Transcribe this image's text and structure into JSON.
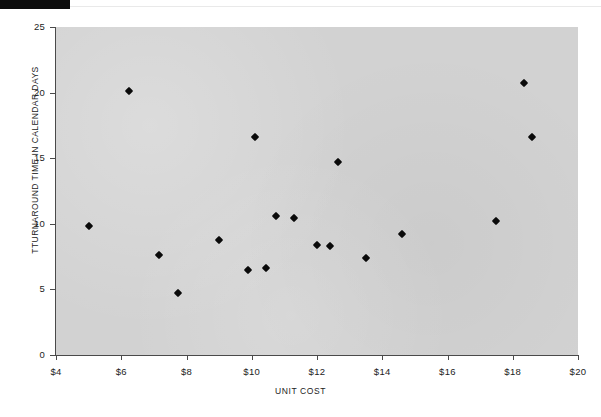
{
  "figure": {
    "top_bar_present": true
  },
  "chart_data": {
    "type": "scatter",
    "title": "",
    "xlabel": "UNIT COST",
    "ylabel": "TTURNAROUND TIME IN CALENDAR DAYS",
    "xlim": [
      4,
      20
    ],
    "ylim": [
      0,
      25
    ],
    "xticks": [
      4,
      6,
      8,
      10,
      12,
      14,
      16,
      18,
      20
    ],
    "xtick_labels": [
      "$4",
      "$6",
      "$8",
      "$10",
      "$12",
      "$14",
      "$16",
      "$18",
      "$20"
    ],
    "yticks": [
      0,
      5,
      10,
      15,
      20,
      25
    ],
    "ytick_labels": [
      "0",
      "5",
      "10",
      "15",
      "20",
      "25"
    ],
    "grid": false,
    "legend": null,
    "marker": "diamond",
    "marker_color": "#0a0a0a",
    "plot_background": "#d2d2d2",
    "points": [
      {
        "x": 5.0,
        "y": 9.8
      },
      {
        "x": 6.25,
        "y": 20.1
      },
      {
        "x": 7.15,
        "y": 7.6
      },
      {
        "x": 7.75,
        "y": 4.75
      },
      {
        "x": 9.0,
        "y": 8.8
      },
      {
        "x": 10.1,
        "y": 16.65
      },
      {
        "x": 9.9,
        "y": 6.5
      },
      {
        "x": 10.45,
        "y": 6.65
      },
      {
        "x": 10.75,
        "y": 10.6
      },
      {
        "x": 11.3,
        "y": 10.45
      },
      {
        "x": 12.0,
        "y": 8.4
      },
      {
        "x": 12.4,
        "y": 8.3
      },
      {
        "x": 12.65,
        "y": 14.7
      },
      {
        "x": 13.5,
        "y": 7.4
      },
      {
        "x": 14.6,
        "y": 9.25
      },
      {
        "x": 17.5,
        "y": 10.25
      },
      {
        "x": 18.35,
        "y": 20.7
      },
      {
        "x": 18.6,
        "y": 16.65
      }
    ]
  }
}
